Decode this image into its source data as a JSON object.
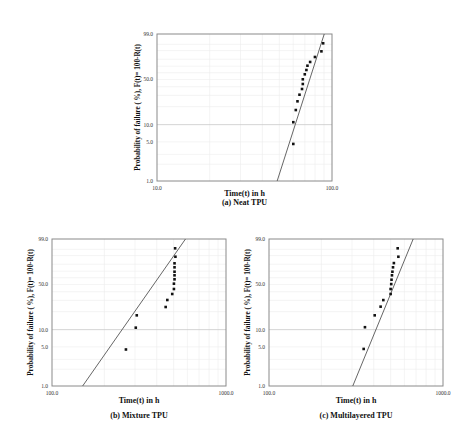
{
  "chart_data": [
    {
      "id": "a",
      "type": "scatter",
      "subtype": "weibull-probability-plot",
      "title": "(a) Neat TPU",
      "xlabel": "Time(t) in h",
      "ylabel": "Probability of failure ( %), F(t)= 100-R(t)",
      "xscale": "log",
      "yscale": "weibull",
      "xlim": [
        10.0,
        100.0
      ],
      "ylim": [
        1.0,
        99.0
      ],
      "xticks": [
        "10.0",
        "100.0"
      ],
      "yticks": [
        "1.0",
        "5.0",
        "10.0",
        "50.0",
        "99.0"
      ],
      "grid": true,
      "highlight_gridline_y": 10.0,
      "series": [
        {
          "name": "Failure data",
          "x": [
            60.1,
            60.1,
            62.1,
            63.5,
            65.2,
            67.4,
            68.1,
            68.1,
            69.9,
            71.4,
            72.4,
            75.0,
            79.9,
            87.0,
            89.0
          ],
          "y": [
            4.6,
            11.0,
            17.6,
            24.3,
            30.7,
            37.2,
            43.6,
            50.2,
            57.6,
            64.2,
            70.7,
            76.2,
            82.9,
            89.3,
            95.6
          ]
        },
        {
          "name": "Weibull fit line",
          "x": [
            48.6,
            90.3
          ],
          "y": [
            1.0,
            99.0
          ]
        }
      ]
    },
    {
      "id": "b",
      "type": "scatter",
      "subtype": "weibull-probability-plot",
      "title": "(b) Mixture TPU",
      "xlabel": "Time(t) in h",
      "ylabel": "Probability of failure ( %), F(t)= 100-R(t)",
      "xscale": "log",
      "yscale": "weibull",
      "xlim": [
        100.0,
        1000.0
      ],
      "ylim": [
        1.0,
        99.0
      ],
      "xticks": [
        "100.0",
        "1000.0"
      ],
      "yticks": [
        "1.0",
        "5.0",
        "10.0",
        "50.0",
        "99.0"
      ],
      "grid": true,
      "highlight_gridline_y": 10.0,
      "series": [
        {
          "name": "Failure data",
          "x": [
            266,
            303,
            307,
            450,
            460,
            491,
            502,
            502,
            506,
            506,
            506,
            506,
            506,
            512,
            510
          ],
          "y": [
            4.5,
            10.8,
            17.4,
            23.7,
            30.4,
            37.2,
            43.6,
            51.1,
            57.6,
            63.7,
            69.2,
            75.7,
            81.2,
            88.9,
            95.6
          ]
        },
        {
          "name": "Weibull fit line",
          "x": [
            150.0,
            585.0
          ],
          "y": [
            1.0,
            99.0
          ]
        }
      ]
    },
    {
      "id": "c",
      "type": "scatter",
      "subtype": "weibull-probability-plot",
      "title": "(c) Multilayered TPU",
      "xlabel": "Time(t) in h",
      "ylabel": "Probability of failure ( %), F(t)= 100-R(t)",
      "xscale": "log",
      "yscale": "weibull",
      "xlim": [
        100.0,
        1000.0
      ],
      "ylim": [
        1.0,
        99.0
      ],
      "xticks": [
        "100.0",
        "1000.0"
      ],
      "yticks": [
        "1.0",
        "5.0",
        "10.0",
        "50.0",
        "99.0"
      ],
      "grid": true,
      "highlight_gridline_y": 10.0,
      "series": [
        {
          "name": "Failure data",
          "x": [
            350,
            356,
            405,
            438,
            454,
            500,
            500,
            504,
            506,
            509,
            512,
            516,
            522,
            554,
            549
          ],
          "y": [
            4.6,
            11.0,
            17.4,
            24.0,
            30.3,
            37.2,
            43.6,
            50.5,
            57.0,
            63.7,
            69.2,
            75.7,
            81.5,
            88.9,
            95.6
          ]
        },
        {
          "name": "Weibull fit line",
          "x": [
            303.0,
            674.0
          ],
          "y": [
            1.0,
            99.0
          ]
        }
      ]
    }
  ]
}
